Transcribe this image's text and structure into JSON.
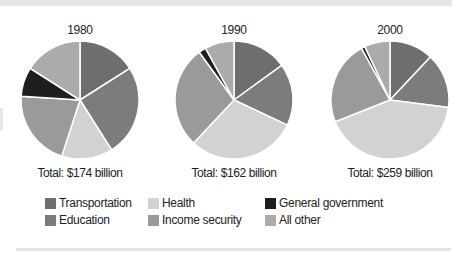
{
  "chart_data": [
    {
      "type": "pie",
      "title": "1980",
      "total_label": "Total: $174 billion",
      "total_billion": 174,
      "categories": [
        "Transportation",
        "Education",
        "Health",
        "Income security",
        "General government",
        "All other"
      ],
      "values": [
        16,
        25,
        14,
        21,
        8,
        16
      ],
      "unit": "percent (estimated)"
    },
    {
      "type": "pie",
      "title": "1990",
      "total_label": "Total: $162 billion",
      "total_billion": 162,
      "categories": [
        "Transportation",
        "Education",
        "Health",
        "Income security",
        "General government",
        "All other"
      ],
      "values": [
        15,
        17,
        30,
        28,
        2,
        8
      ],
      "unit": "percent (estimated)"
    },
    {
      "type": "pie",
      "title": "2000",
      "total_label": "Total: $259 billion",
      "total_billion": 259,
      "categories": [
        "Transportation",
        "Education",
        "Health",
        "Income security",
        "General government",
        "All other"
      ],
      "values": [
        12,
        15,
        42,
        23,
        1,
        7
      ],
      "unit": "percent (estimated)"
    }
  ],
  "legend": {
    "position": "bottom",
    "items": [
      {
        "label": "Transportation",
        "color": "#6e6e6e"
      },
      {
        "label": "Education",
        "color": "#7c7c7c"
      },
      {
        "label": "Health",
        "color": "#d2d2d2"
      },
      {
        "label": "Income security",
        "color": "#9a9a9a"
      },
      {
        "label": "General government",
        "color": "#1e1e1e"
      },
      {
        "label": "All other",
        "color": "#ababab"
      }
    ]
  },
  "pies": [
    {
      "year": "1980",
      "total": "Total: $174 billion"
    },
    {
      "year": "1990",
      "total": "Total: $162 billion"
    },
    {
      "year": "2000",
      "total": "Total: $259 billion"
    }
  ]
}
